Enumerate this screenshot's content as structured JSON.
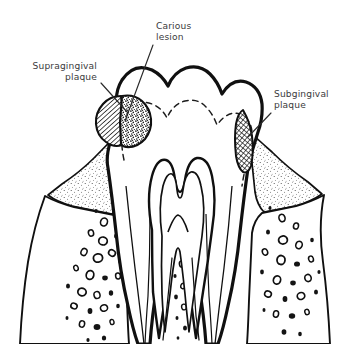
{
  "figure": {
    "type": "anatomical-line-diagram",
    "background_color": "#ffffff",
    "ink_color": "#101010",
    "label_color": "#3a3a3c"
  },
  "labels": [
    {
      "id": "supragingival-plaque",
      "line1": "Supragingival",
      "line2": "plaque",
      "align": "right",
      "text_x": 97,
      "text_y1": 69,
      "text_y2": 80,
      "leader": {
        "x1": 101,
        "y1": 83,
        "x2": 128,
        "y2": 113
      }
    },
    {
      "id": "carious-lesion",
      "line1": "Carious",
      "line2": "lesion",
      "align": "left",
      "text_x": 156,
      "text_y1": 29,
      "text_y2": 40,
      "leader": {
        "x1": 153,
        "y1": 45,
        "x2": 125,
        "y2": 121
      }
    },
    {
      "id": "subgingival-plaque",
      "line1": "Subgingival",
      "line2": "plaque",
      "align": "left",
      "text_x": 274,
      "text_y1": 97,
      "text_y2": 108,
      "leader": {
        "x1": 271,
        "y1": 113,
        "x2": 248,
        "y2": 137
      }
    }
  ],
  "structures": {
    "enamel_crown": "outer crown outline with cusps",
    "dentino_enamel_junction": "dashed line following crown contour",
    "pulp_chamber": "W-shaped chamber with two pulp horns and root canals",
    "gingiva": "stippled triangular gingival tissue on both sides",
    "alveolar_bone": "trabecular bone drawn as irregular blobs",
    "periodontal_ligament": "thin paired lines along each root",
    "roots": 2
  },
  "textures": {
    "supragingival_plaque": "diagonal-hatch",
    "carious_lesion": "dense-stipple",
    "subgingival_plaque": "cross-hatch",
    "gingiva": "fine-stipple",
    "bone": "irregular-blobs"
  }
}
